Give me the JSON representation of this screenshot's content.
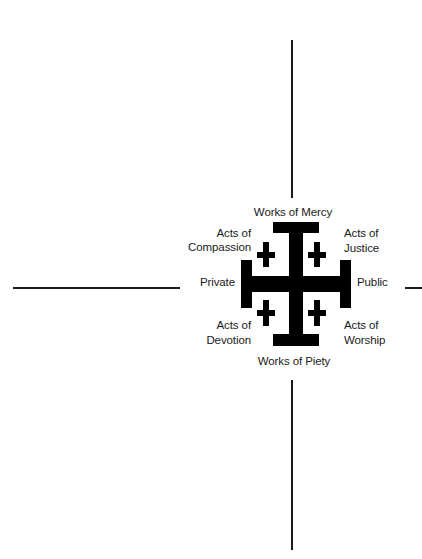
{
  "diagram": {
    "type": "jerusalem-cross-quadrant-diagram",
    "center_symbol": "jerusalem-cross",
    "axes": {
      "top": "Works of Mercy",
      "bottom": "Works of Piety",
      "left": "Private",
      "right": "Public"
    },
    "quadrants": {
      "upper_left": {
        "line1": "Acts of",
        "line2": "Compassion"
      },
      "upper_right": {
        "line1": "Acts of",
        "line2": "Justice"
      },
      "lower_left": {
        "line1": "Acts of",
        "line2": "Devotion"
      },
      "lower_right": {
        "line1": "Acts of",
        "line2": "Worship"
      }
    },
    "colors": {
      "ink": "#000000",
      "background": "#ffffff"
    }
  }
}
